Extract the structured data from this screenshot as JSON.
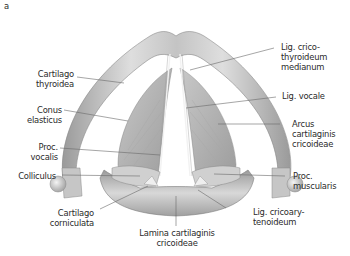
{
  "figure": {
    "panel_letter": "a",
    "labels": {
      "cartilago_thyroidea": "Cartilago\nthyroidea",
      "conus_elasticus": "Conus\nelasticus",
      "proc_vocalis": "Proc.\nvocalis",
      "colliculus": "Colliculus",
      "cartilago_corniculata": "Cartilago\ncorniculata",
      "lamina": "Lamina cartilaginis\ncricoideae",
      "lig_cricothyroideum": "Lig. crico-\nthyroideum\nmedianum",
      "lig_vocale": "Lig. vocale",
      "arcus": "Arcus\ncartilaginis\ncricoideae",
      "proc_muscularis": "Proc.\nmuscularis",
      "lig_cricoarytenoideum": "Lig. cricoary-\ntenoideum"
    },
    "colors": {
      "cartilage_light": "#e4e4e4",
      "cartilage_mid": "#b8b8b8",
      "cartilage_dark": "#8a8a8a",
      "leader_line": "#6a6a6a",
      "text": "#2a2a2a"
    }
  }
}
